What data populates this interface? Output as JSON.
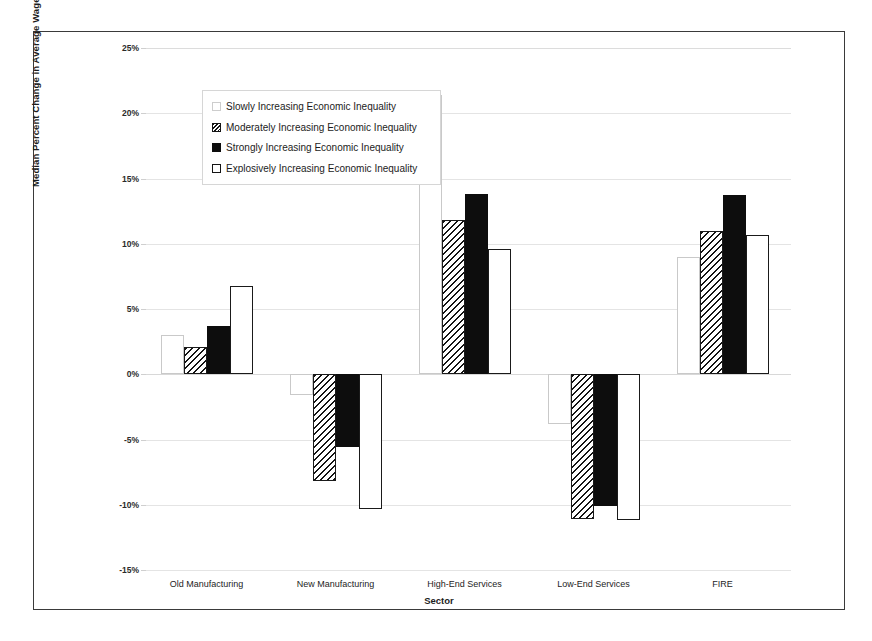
{
  "chart_data": {
    "type": "bar",
    "title": "",
    "xlabel": "Sector",
    "ylabel": "Median Percent Change in Average Wages from 1970 to 2000",
    "categories": [
      "Old Manufacturing",
      "New Manufacturing",
      "High-End Services",
      "Low-End Services",
      "FIRE"
    ],
    "series": [
      {
        "name": "Slowly Increasing Economic Inequality",
        "values": [
          3.0,
          -1.6,
          21.4,
          -3.8,
          9.0
        ]
      },
      {
        "name": "Moderately Increasing Economic Inequality",
        "values": [
          2.1,
          -8.2,
          11.8,
          -11.1,
          11.0
        ]
      },
      {
        "name": "Strongly Increasing Economic Inequality",
        "values": [
          3.7,
          -5.6,
          13.8,
          -10.1,
          13.7
        ]
      },
      {
        "name": "Explosively Increasing Economic Inequality",
        "values": [
          6.8,
          -10.3,
          9.6,
          -11.2,
          10.7
        ]
      }
    ],
    "ylim": [
      -15,
      25
    ],
    "yticks": [
      "25%",
      "20%",
      "15%",
      "10%",
      "5%",
      "0%",
      "-5%",
      "-10%",
      "-15%"
    ],
    "ytick_values": [
      25,
      20,
      15,
      10,
      5,
      0,
      -5,
      -10,
      -15
    ],
    "grid": true,
    "legend_position": "upper-left-inside"
  },
  "legend": {
    "items": [
      {
        "label": "Slowly Increasing Economic Inequality",
        "swatch": "open-light-square-swatch"
      },
      {
        "label": "Moderately Increasing Economic Inequality",
        "swatch": "diagonal-hatch-square-swatch"
      },
      {
        "label": "Strongly Increasing Economic Inequality",
        "swatch": "solid-black-square-swatch"
      },
      {
        "label": "Explosively Increasing Economic Inequality",
        "swatch": "open-outlined-square-swatch"
      }
    ]
  },
  "colors": {
    "frame": "#3a3a3a",
    "grid": "#e4e4e4",
    "series_strongly": "#0d0d0d",
    "series_hatch": "#151515",
    "background": "#ffffff"
  }
}
